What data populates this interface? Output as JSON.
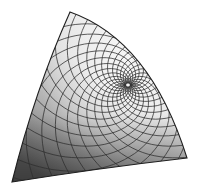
{
  "figure": {
    "caption": "",
    "corners": {
      "top": [
        70,
        12
      ],
      "bottom_left": [
        12,
        182
      ],
      "bottom_right": [
        187,
        158
      ]
    },
    "pole": [
      128,
      85
    ],
    "colors": {
      "background": "#ffffff",
      "mesh_line": "#2e2e2e",
      "outline": "#1f1f1f",
      "shade_light": "#f4f4f4",
      "shade_mid": "#c4c4c4",
      "shade_dark": "#6e6e6e"
    },
    "mesh": {
      "spiral_families": 2,
      "curves_per_family": 22,
      "twist": 2.2
    }
  }
}
